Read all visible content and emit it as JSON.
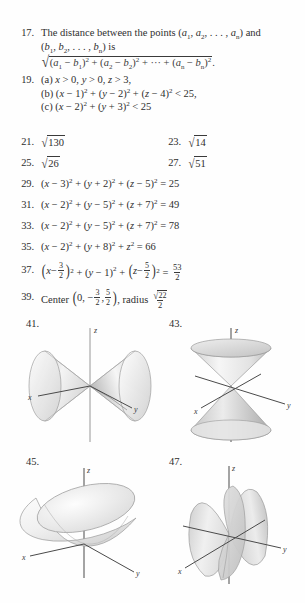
{
  "page": {
    "background_color": "#fefefe",
    "text_color": "#2e2e2e"
  },
  "answers": [
    {
      "number": "17.",
      "type": "text_plus_formula",
      "line1_prefix": "The distance between the points (",
      "line1_a": "a",
      "line1_sub1": "1",
      "line1_mid": ", ",
      "line1_a2": "a",
      "line1_sub2": "2",
      "line1_dots": ", . . . , ",
      "line1_an": "a",
      "line1_subn": "n",
      "line1_suffix": ") and",
      "line2": "(b₁, b₂, . . . , bₙ) is",
      "formula": "√((a₁ − b₁)² + (a₂ − b₂)² + ⋯ + (aₙ − bₙ)²)."
    },
    {
      "number": "19.",
      "type": "parts",
      "parts": [
        "(a) x > 0, y > 0, z > 3,",
        "(b) (x − 1)² + (y − 2)² + (z − 4)² < 25,",
        "(c) (x − 2)² + (y + 3)² < 25"
      ]
    },
    {
      "number": "21.",
      "type": "sqrt",
      "radicand": "130"
    },
    {
      "number": "23.",
      "type": "sqrt",
      "radicand": "14"
    },
    {
      "number": "25.",
      "type": "sqrt",
      "radicand": "26"
    },
    {
      "number": "27.",
      "type": "sqrt",
      "radicand": "51"
    },
    {
      "number": "29.",
      "type": "equation",
      "text": "(x − 3)² + (y + 2)² + (z − 5)² = 25"
    },
    {
      "number": "31.",
      "type": "equation",
      "text": "(x − 2)² + (y − 5)² + (z + 7)² = 49"
    },
    {
      "number": "33.",
      "type": "equation",
      "text": "(x − 2)² + (y − 5)² + (z + 7)² = 78"
    },
    {
      "number": "35.",
      "type": "equation",
      "text": "(x − 2)² + (y + 8)² + z² = 66"
    },
    {
      "number": "37.",
      "type": "equation_fractions",
      "text": "(x − 3/2)² + (y − 1)² + (z − 5/2)² = 53/2",
      "f1_num": "3",
      "f1_den": "2",
      "f2_num": "5",
      "f2_den": "2",
      "rhs_num": "53",
      "rhs_den": "2"
    },
    {
      "number": "39.",
      "type": "center_radius",
      "label_center": "Center",
      "label_radius": "radius",
      "center_x": "0",
      "center_y_num": "3",
      "center_y_den": "2",
      "center_z_num": "5",
      "center_z_den": "2",
      "radius_radicand": "22",
      "radius_den": "2"
    }
  ],
  "figures": [
    {
      "number": "41.",
      "name": "double-cone-along-y-axis",
      "kind": "double cone opening along y-axis",
      "axis_labels": {
        "x": "x",
        "y": "y",
        "z": "z"
      }
    },
    {
      "number": "43.",
      "name": "double-cone-along-z-axis",
      "kind": "double cone opening along z-axis",
      "axis_labels": {
        "x": "x",
        "y": "y",
        "z": "z"
      }
    },
    {
      "number": "45.",
      "name": "elliptic-paraboloid-bowl",
      "kind": "elliptic paraboloid opening upward",
      "axis_labels": {
        "x": "x",
        "y": "y",
        "z": "z"
      }
    },
    {
      "number": "47.",
      "name": "hyperbolic-paraboloid-saddle",
      "kind": "hyperbolic paraboloid (saddle)",
      "axis_labels": {
        "x": "x",
        "y": "y",
        "z": "z"
      }
    }
  ]
}
